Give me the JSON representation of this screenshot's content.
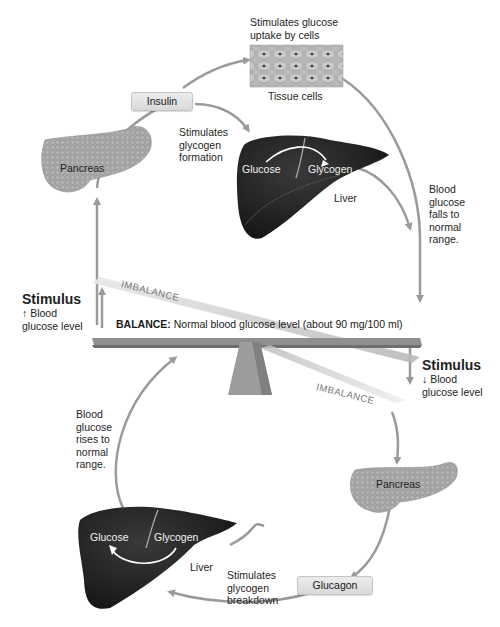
{
  "top": {
    "tissue_caption": "Stimulates glucose uptake by cells",
    "tissue_caption_line1": "Stimulates glucose",
    "tissue_caption_line2": "uptake by cells",
    "tissue_label": "Tissue cells",
    "insulin_box": "Insulin",
    "pancreas_label": "Pancreas",
    "glycogen_formation": [
      "Stimulates",
      "glycogen",
      "formation"
    ],
    "liver": {
      "glucose": "Glucose",
      "glycogen": "Glycogen",
      "label": "Liver"
    },
    "falls": [
      "Blood",
      "glucose",
      "falls to",
      "normal",
      "range."
    ]
  },
  "middle": {
    "stimulus_up": {
      "title": "Stimulus",
      "arrow": "↑",
      "line1": "Blood",
      "line2": "glucose level"
    },
    "stimulus_down": {
      "title": "Stimulus",
      "arrow": "↓",
      "line1": "Blood",
      "line2": "glucose level"
    },
    "imbalance_top": "IMBALANCE",
    "imbalance_bottom": "IMBALANCE",
    "balance_bold": "BALANCE:",
    "balance_text": " Normal blood glucose level (about 90 mg/100 ml)"
  },
  "bottom": {
    "pancreas_label": "Pancreas",
    "glucagon_box": "Glucagon",
    "glycogen_breakdown": [
      "Stimulates",
      "glycogen",
      "breakdown"
    ],
    "liver": {
      "glucose": "Glucose",
      "glycogen": "Glycogen",
      "label": "Liver"
    },
    "rises": [
      "Blood",
      "glucose",
      "rises to",
      "normal",
      "range."
    ]
  },
  "colors": {
    "arrow": "#9a9a9a",
    "liver": "#1c1c1c",
    "pancreas": "#a8a8a8",
    "box": "#e0e0e0",
    "beam": "#8a8a8a"
  }
}
